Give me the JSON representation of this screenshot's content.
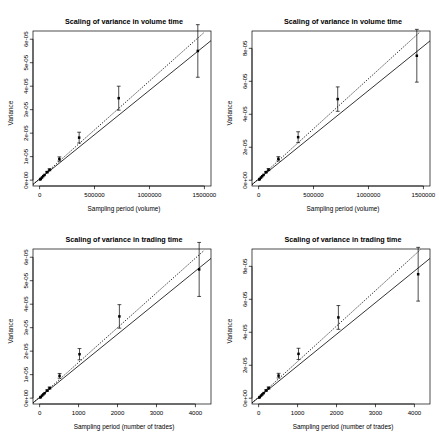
{
  "figure": {
    "name": "scaling-of-variance-four-panel-figure",
    "background": "#ffffff",
    "foreground": "#000000",
    "panel_count": 4
  },
  "chart_data": [
    {
      "id": "top-left",
      "type": "scatter",
      "title": "Scaling of variance in volume time",
      "xlabel": "Sampling period (volume)",
      "ylabel": "Variance",
      "xlim": [
        -60000,
        1560000
      ],
      "ylim": [
        -2.5e-06,
        6.35e-05
      ],
      "xticks": [
        0,
        500000,
        1000000,
        1500000
      ],
      "xticklabels": [
        "0",
        "500000",
        "1000000",
        "1500000"
      ],
      "yticks": [
        0,
        1e-05,
        2e-05,
        3e-05,
        4e-05,
        5e-05,
        6e-05
      ],
      "yticklabels": [
        "0e+00",
        "1e-05",
        "2e-05",
        "3e-05",
        "4e-05",
        "5e-05",
        "6e-05"
      ],
      "grid": false,
      "legend": "none",
      "series": [
        {
          "name": "observed variance",
          "marker": "filled-square",
          "x": [
            5500,
            11000,
            22000,
            33000,
            45000,
            68000,
            90000,
            180000,
            360000,
            720000,
            1440000
          ],
          "y": [
            2.8e-07,
            5.5e-07,
            1.1e-06,
            1.7e-06,
            2.2e-06,
            3.4e-06,
            4.4e-06,
            9e-06,
            1.81e-05,
            3.49e-05,
            5.5e-05
          ],
          "yerr_low": [
            3e-08,
            5e-08,
            1e-07,
            1.5e-07,
            2e-07,
            3e-07,
            4e-07,
            9e-07,
            2.3e-06,
            5.1e-06,
            1.12e-05
          ],
          "yerr_high": [
            3e-08,
            5e-08,
            1e-07,
            1.5e-07,
            2e-07,
            3e-07,
            4e-07,
            9e-07,
            2.3e-06,
            5.1e-06,
            1.12e-05
          ]
        },
        {
          "name": "fitted line",
          "type": "line",
          "style": "solid",
          "x": [
            -60000,
            1560000
          ],
          "y": [
            -1.8e-06,
            5.94e-05
          ]
        },
        {
          "name": "reference line",
          "type": "line",
          "style": "dotted",
          "x": [
            -60000,
            1500000
          ],
          "y": [
            -1.9e-06,
            6.3e-05
          ]
        }
      ]
    },
    {
      "id": "top-right",
      "type": "scatter",
      "title": "Scaling of variance in volume time",
      "xlabel": "Sampling period (volume)",
      "ylabel": "Variance",
      "xlim": [
        -60000,
        1560000
      ],
      "ylim": [
        -3.5e-06,
        9.05e-05
      ],
      "xticks": [
        0,
        500000,
        1000000,
        1500000
      ],
      "xticklabels": [
        "0",
        "500000",
        "1000000",
        "1500000"
      ],
      "yticks": [
        0,
        2e-05,
        4e-05,
        6e-05,
        8e-05
      ],
      "yticklabels": [
        "0e+00",
        "2e-05",
        "4e-05",
        "6e-05",
        "8e-05"
      ],
      "grid": false,
      "legend": "none",
      "series": [
        {
          "name": "observed variance",
          "marker": "filled-square",
          "x": [
            5500,
            11000,
            22000,
            33000,
            45000,
            68000,
            90000,
            180000,
            360000,
            720000,
            1440000
          ],
          "y": [
            4e-07,
            8e-07,
            1.6e-06,
            2.4e-06,
            3.2e-06,
            4.9e-06,
            6.4e-06,
            1.3e-05,
            2.61e-05,
            4.92e-05,
            7.55e-05
          ],
          "yerr_low": [
            4e-08,
            8e-08,
            1.5e-07,
            2e-07,
            3e-07,
            4e-07,
            6e-07,
            1.3e-06,
            3.3e-06,
            7.4e-06,
            1.6e-05
          ],
          "yerr_high": [
            4e-08,
            8e-08,
            1.5e-07,
            2e-07,
            3e-07,
            4e-07,
            6e-07,
            1.3e-06,
            3.3e-06,
            7.4e-06,
            1.6e-05
          ]
        },
        {
          "name": "fitted line",
          "type": "line",
          "style": "solid",
          "x": [
            -60000,
            1560000
          ],
          "y": [
            -2.6e-06,
            8.45e-05
          ]
        },
        {
          "name": "reference line",
          "type": "line",
          "style": "dotted",
          "x": [
            -60000,
            1470000
          ],
          "y": [
            -2.7e-06,
            9e-05
          ]
        }
      ]
    },
    {
      "id": "bottom-left",
      "type": "scatter",
      "title": "Scaling of variance in trading time",
      "xlabel": "Sampling period (number of trades)",
      "ylabel": "Variance",
      "xlim": [
        -170,
        4400
      ],
      "ylim": [
        -2.5e-06,
        6.35e-05
      ],
      "xticks": [
        0,
        1000,
        2000,
        3000,
        4000
      ],
      "xticklabels": [
        "0",
        "1000",
        "2000",
        "3000",
        "4000"
      ],
      "yticks": [
        0,
        1e-05,
        2e-05,
        3e-05,
        4e-05,
        5e-05,
        6e-05
      ],
      "yticklabels": [
        "0e+00",
        "1e-05",
        "2e-05",
        "3e-05",
        "4e-05",
        "5e-05",
        "6e-05"
      ],
      "grid": false,
      "legend": "none",
      "series": [
        {
          "name": "observed variance",
          "marker": "filled-square",
          "x": [
            16,
            32,
            64,
            95,
            128,
            192,
            256,
            512,
            1024,
            2048,
            4096
          ],
          "y": [
            2.7e-07,
            5.4e-07,
            1.1e-06,
            1.6e-06,
            2.1e-06,
            3.2e-06,
            4.3e-06,
            9.5e-06,
            1.87e-05,
            3.48e-05,
            5.48e-05
          ],
          "yerr_low": [
            3e-08,
            5e-08,
            1e-07,
            1.5e-07,
            2e-07,
            3e-07,
            4e-07,
            1e-06,
            2.4e-06,
            5e-06,
            1.15e-05
          ],
          "yerr_high": [
            3e-08,
            5e-08,
            1e-07,
            1.5e-07,
            2e-07,
            3e-07,
            4e-07,
            1e-06,
            2.4e-06,
            5e-06,
            1.15e-05
          ]
        },
        {
          "name": "fitted line",
          "type": "line",
          "style": "solid",
          "x": [
            -170,
            4400
          ],
          "y": [
            -2e-06,
            5.95e-05
          ]
        },
        {
          "name": "reference line",
          "type": "line",
          "style": "dotted",
          "x": [
            -170,
            4230
          ],
          "y": [
            -2.1e-06,
            6.3e-05
          ]
        }
      ]
    },
    {
      "id": "bottom-right",
      "type": "scatter",
      "title": "Scaling of variance in trading time",
      "xlabel": "Sampling period (number of trades)",
      "ylabel": "Variance",
      "xlim": [
        -170,
        4400
      ],
      "ylim": [
        -3.5e-06,
        9.05e-05
      ],
      "xticks": [
        0,
        1000,
        2000,
        3000,
        4000
      ],
      "xticklabels": [
        "0",
        "1000",
        "2000",
        "3000",
        "4000"
      ],
      "yticks": [
        0,
        2e-05,
        4e-05,
        6e-05,
        8e-05
      ],
      "yticklabels": [
        "0e+00",
        "2e-05",
        "4e-05",
        "6e-05",
        "8e-05"
      ],
      "grid": false,
      "legend": "none",
      "series": [
        {
          "name": "observed variance",
          "marker": "filled-square",
          "x": [
            16,
            32,
            64,
            95,
            128,
            192,
            256,
            512,
            1024,
            2048,
            4096
          ],
          "y": [
            3.9e-07,
            7.8e-07,
            1.6e-06,
            2.3e-06,
            3.1e-06,
            4.7e-06,
            6.2e-06,
            1.37e-05,
            2.69e-05,
            4.9e-05,
            7.52e-05
          ],
          "yerr_low": [
            4e-08,
            8e-08,
            1.5e-07,
            2e-07,
            3e-07,
            4e-07,
            6e-07,
            1.4e-06,
            3.4e-06,
            7.2e-06,
            1.63e-05
          ],
          "yerr_high": [
            4e-08,
            8e-08,
            1.5e-07,
            2e-07,
            3e-07,
            4e-07,
            6e-07,
            1.4e-06,
            3.4e-06,
            7.2e-06,
            1.63e-05
          ]
        },
        {
          "name": "fitted line",
          "type": "line",
          "style": "solid",
          "x": [
            -170,
            4400
          ],
          "y": [
            -2.8e-06,
            8.48e-05
          ]
        },
        {
          "name": "reference line",
          "type": "line",
          "style": "dotted",
          "x": [
            -170,
            4150
          ],
          "y": [
            -2.9e-06,
            9e-05
          ]
        }
      ]
    }
  ]
}
